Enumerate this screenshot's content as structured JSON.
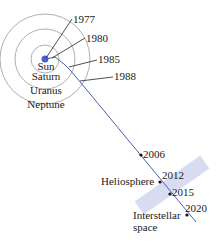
{
  "diagram": {
    "center_labels": [
      "Sun",
      "Saturn",
      "Uranus",
      "Neptune"
    ],
    "years": [
      "1977",
      "1980",
      "1985",
      "1988",
      "2006",
      "2012",
      "2015",
      "2020"
    ],
    "regions": {
      "heliosphere": "Heliosphere",
      "interstellar_line1": "Interstellar",
      "interstellar_line2": "space"
    },
    "colors": {
      "trajectory": "#4a5fb0",
      "orbit": "#9a9a9a",
      "sun": "#4a5fd0",
      "heliopause_band": "#d8dcf0",
      "leader": "#222222"
    }
  }
}
